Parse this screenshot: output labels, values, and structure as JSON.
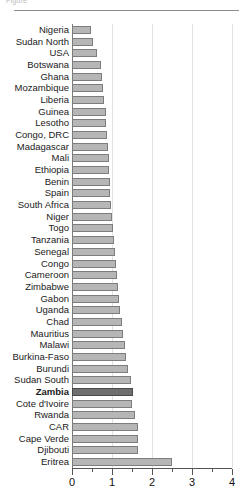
{
  "header": {
    "clipped_text": "Figure",
    "has_rule": true
  },
  "chart_data": {
    "type": "bar",
    "orientation": "horizontal",
    "title": "",
    "subtitle": "",
    "xlabel": "",
    "ylabel": "",
    "xlim": [
      0,
      4
    ],
    "xticks": [
      0,
      1,
      2,
      3,
      4
    ],
    "xtick_labels": [
      "0",
      "1",
      "2",
      "3",
      "4"
    ],
    "minor_xticks": [
      0.5,
      1.5,
      2.5,
      3.5
    ],
    "grid": "vertical",
    "legend": "none",
    "highlight_category": "Zambia",
    "colors": {
      "bar_fill": "#b6b6b6",
      "bar_edge": "#7d7d7d",
      "highlight_fill": "#6e6e6e",
      "highlight_edge": "#4a4a4a",
      "gridline": "#e2e2e2",
      "axis": "#555555",
      "text": "#1a1a1a"
    },
    "categories": [
      "Nigeria",
      "Sudan North",
      "USA",
      "Botswana",
      "Ghana",
      "Mozambique",
      "Liberia",
      "Guinea",
      "Lesotho",
      "Congo, DRC",
      "Madagascar",
      "Mali",
      "Ethiopia",
      "Benin",
      "Spain",
      "South Africa",
      "Niger",
      "Togo",
      "Tanzania",
      "Senegal",
      "Congo",
      "Cameroon",
      "Zimbabwe",
      "Gabon",
      "Uganda",
      "Chad",
      "Mauritius",
      "Malawi",
      "Burkina-Faso",
      "Burundi",
      "Sudan South",
      "Zambia",
      "Cote d'Ivoire",
      "Rwanda",
      "CAR",
      "Cape Verde",
      "Djibouti",
      "Eritrea"
    ],
    "values": [
      0.48,
      0.52,
      0.62,
      0.73,
      0.75,
      0.78,
      0.8,
      0.85,
      0.86,
      0.88,
      0.9,
      0.92,
      0.93,
      0.95,
      0.96,
      0.97,
      1.0,
      1.02,
      1.05,
      1.08,
      1.1,
      1.12,
      1.15,
      1.18,
      1.2,
      1.24,
      1.28,
      1.32,
      1.36,
      1.4,
      1.47,
      1.52,
      1.5,
      1.58,
      1.65,
      1.65,
      1.66,
      2.5
    ]
  }
}
